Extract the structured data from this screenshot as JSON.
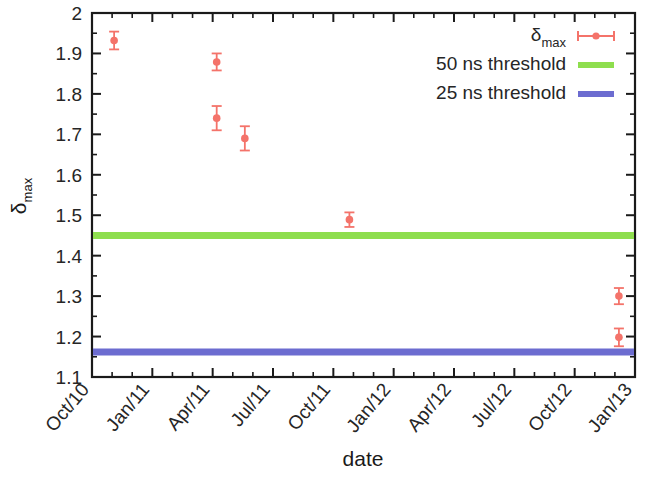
{
  "chart_data": {
    "type": "scatter",
    "title": "",
    "xlabel": "date",
    "ylabel": "δmax",
    "ylabel_base": "δ",
    "ylabel_sub": "max",
    "ylim": [
      1.1,
      2.0
    ],
    "ytick_labels": [
      "2",
      "1.9",
      "1.8",
      "1.7",
      "1.6",
      "1.5",
      "1.4",
      "1.3",
      "1.2",
      "1.1"
    ],
    "ytick_values": [
      2.0,
      1.9,
      1.8,
      1.7,
      1.6,
      1.5,
      1.4,
      1.3,
      1.2,
      1.1
    ],
    "xtick_labels": [
      "Oct/10",
      "Jan/11",
      "Apr/11",
      "Jul/11",
      "Oct/11",
      "Jan/12",
      "Apr/12",
      "Jul/12",
      "Oct/12",
      "Jan/13"
    ],
    "xtick_months": [
      0,
      3,
      6,
      9,
      12,
      15,
      18,
      21,
      24,
      27
    ],
    "x_minor_per_major": 3,
    "xlim_months": [
      0,
      27
    ],
    "grid": false,
    "legend_position": "top-right",
    "series": [
      {
        "name": "δmax",
        "name_base": "δ",
        "name_sub": "max",
        "type": "scatter-errorbar",
        "color": "#f4736a",
        "points": [
          {
            "x_label": "Oct/10",
            "x_months": 1.1,
            "y": 1.932,
            "yerr": 0.022
          },
          {
            "x_label": "Apr/11",
            "x_months": 6.2,
            "y": 1.879,
            "yerr": 0.021
          },
          {
            "x_label": "Apr/11",
            "x_months": 6.2,
            "y": 1.74,
            "yerr": 0.03
          },
          {
            "x_label": "May/11",
            "x_months": 7.6,
            "y": 1.69,
            "yerr": 0.03
          },
          {
            "x_label": "Nov/11",
            "x_months": 12.8,
            "y": 1.489,
            "yerr": 0.018
          },
          {
            "x_label": "Dec/12",
            "x_months": 26.2,
            "y": 1.3,
            "yerr": 0.02
          },
          {
            "x_label": "Dec/12",
            "x_months": 26.2,
            "y": 1.198,
            "yerr": 0.022
          }
        ]
      },
      {
        "name": "50 ns threshold",
        "type": "hline",
        "color": "#8ede4e",
        "value": 1.45
      },
      {
        "name": "25 ns threshold",
        "type": "hline",
        "color": "#6c6cd0",
        "value": 1.162
      }
    ]
  },
  "legend": {
    "entries": [
      {
        "label": "δmax",
        "label_base": "δ",
        "label_sub": "max",
        "marker": "errorbar-point",
        "color": "#f4736a"
      },
      {
        "label": "50 ns threshold",
        "marker": "line",
        "color": "#8ede4e"
      },
      {
        "label": "25 ns threshold",
        "marker": "line",
        "color": "#6c6cd0"
      }
    ]
  },
  "axes": {
    "x_title": "date",
    "y_title_base": "δ",
    "y_title_sub": "max"
  }
}
